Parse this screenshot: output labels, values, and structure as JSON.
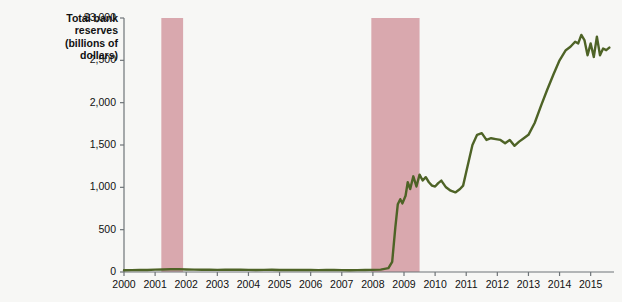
{
  "chart_data": {
    "type": "line",
    "title": "Total bank reserves (billions of dollars)",
    "title_lines": "Total bank\nreserves\n(billions of\ndollars)",
    "xlabel": "",
    "ylabel": "Total bank reserves (billions of dollars)",
    "xlim": [
      2000,
      2015.75
    ],
    "ylim": [
      0,
      3000
    ],
    "grid": false,
    "legend": null,
    "line_color": "#4e6326",
    "recession_color": "#d9a8ae",
    "axis_color": "#6e7478",
    "background_color": "#f7f7f5",
    "yticks": [
      0,
      500,
      1000,
      1500,
      2000,
      2500,
      3000
    ],
    "ytick_labels": [
      "0",
      "500",
      "1,000",
      "1,500",
      "2,000",
      "2,500",
      "$3,000"
    ],
    "xticks": [
      2000,
      2001,
      2002,
      2003,
      2004,
      2005,
      2006,
      2007,
      2008,
      2009,
      2010,
      2011,
      2012,
      2013,
      2014,
      2015
    ],
    "xtick_labels": [
      "2000",
      "2001",
      "2002",
      "2003",
      "2004",
      "2005",
      "2006",
      "2007",
      "2008",
      "2009",
      "2010",
      "2011",
      "2012",
      "2013",
      "2014",
      "2015"
    ],
    "recession_bands": [
      {
        "start": 2001.2,
        "end": 2001.9
      },
      {
        "start": 2007.95,
        "end": 2009.5
      }
    ],
    "series": [
      {
        "name": "Total bank reserves",
        "color": "#4e6326",
        "x": [
          2000.0,
          2000.25,
          2000.5,
          2000.75,
          2001.0,
          2001.25,
          2001.5,
          2001.75,
          2002.0,
          2002.25,
          2002.5,
          2002.75,
          2003.0,
          2003.25,
          2003.5,
          2003.75,
          2004.0,
          2004.25,
          2004.5,
          2004.75,
          2005.0,
          2005.25,
          2005.5,
          2005.75,
          2006.0,
          2006.25,
          2006.5,
          2006.75,
          2007.0,
          2007.25,
          2007.5,
          2007.75,
          2008.0,
          2008.25,
          2008.5,
          2008.62,
          2008.72,
          2008.8,
          2008.88,
          2008.95,
          2009.05,
          2009.12,
          2009.2,
          2009.3,
          2009.4,
          2009.5,
          2009.6,
          2009.7,
          2009.8,
          2009.9,
          2010.0,
          2010.1,
          2010.2,
          2010.35,
          2010.5,
          2010.65,
          2010.8,
          2010.9,
          2011.0,
          2011.1,
          2011.2,
          2011.35,
          2011.5,
          2011.65,
          2011.8,
          2011.95,
          2012.1,
          2012.25,
          2012.4,
          2012.55,
          2012.7,
          2012.85,
          2013.0,
          2013.2,
          2013.4,
          2013.6,
          2013.8,
          2014.0,
          2014.2,
          2014.35,
          2014.5,
          2014.6,
          2014.7,
          2014.8,
          2014.9,
          2015.0,
          2015.1,
          2015.2,
          2015.3,
          2015.4,
          2015.5,
          2015.6
        ],
        "y": [
          20,
          22,
          24,
          23,
          28,
          30,
          32,
          34,
          30,
          28,
          27,
          26,
          25,
          26,
          27,
          26,
          25,
          24,
          25,
          26,
          24,
          23,
          24,
          25,
          23,
          22,
          23,
          24,
          22,
          21,
          22,
          24,
          25,
          28,
          45,
          120,
          520,
          800,
          860,
          810,
          900,
          1060,
          980,
          1130,
          1010,
          1150,
          1080,
          1120,
          1060,
          1020,
          1010,
          1050,
          1080,
          1000,
          960,
          940,
          980,
          1020,
          1180,
          1340,
          1500,
          1620,
          1640,
          1560,
          1580,
          1570,
          1560,
          1520,
          1560,
          1490,
          1540,
          1580,
          1620,
          1760,
          1960,
          2150,
          2330,
          2500,
          2620,
          2660,
          2720,
          2700,
          2800,
          2740,
          2560,
          2700,
          2540,
          2780,
          2560,
          2640,
          2620,
          2650
        ]
      }
    ]
  }
}
